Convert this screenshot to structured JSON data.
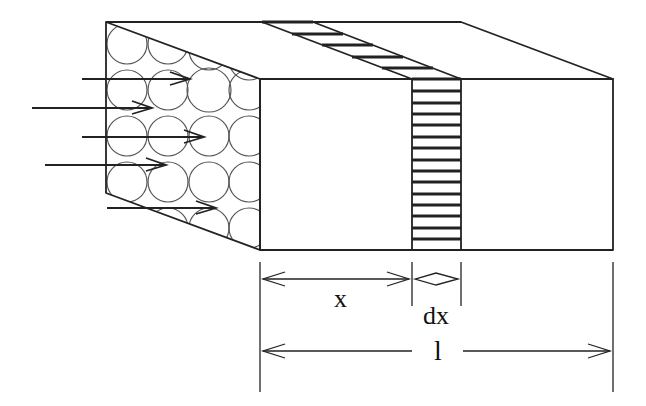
{
  "diagram": {
    "colors": {
      "stroke": "#222222",
      "circle_stroke": "#555555",
      "background": "#ffffff"
    },
    "labels": {
      "x": "x",
      "dx": "dx",
      "length": "l"
    },
    "flow_arrows": [
      {
        "x1": 82,
        "x2": 190,
        "y": 79
      },
      {
        "x1": 32,
        "x2": 152,
        "y": 108
      },
      {
        "x1": 82,
        "x2": 204,
        "y": 137
      },
      {
        "x1": 45,
        "x2": 166,
        "y": 165
      },
      {
        "x1": 107,
        "x2": 216,
        "y": 208
      }
    ]
  }
}
